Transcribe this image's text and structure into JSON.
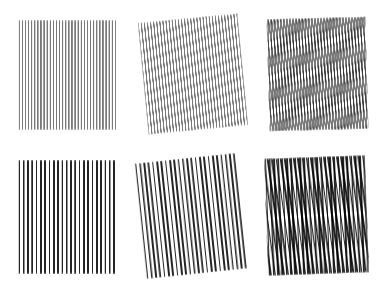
{
  "figure": {
    "background_color": "#ffffff",
    "width": 388,
    "height": 291,
    "rows": 2,
    "columns": 3
  },
  "colors": {
    "background": "#ffffff",
    "line_stroke": "#6e6e6e",
    "dot_fill": "#191919"
  },
  "panels": [
    {
      "id": "panel-1",
      "name": "line-grating-base",
      "row": 1,
      "column": 1,
      "pattern": "vertical-line-grating",
      "x": 18,
      "y": 20,
      "width": 99,
      "height": 110,
      "layers": [
        {
          "type": "lines",
          "orientation": "vertical",
          "period_px": 3.1,
          "rotation_deg": 0,
          "stroke": "#6e6e6e"
        }
      ],
      "rotation_deg": 0,
      "caption": ""
    },
    {
      "id": "panel-2",
      "name": "line-grating-rotated",
      "row": 1,
      "column": 2,
      "pattern": "vertical-line-grating-rotated",
      "x": 143,
      "y": 18,
      "width": 100,
      "height": 112,
      "layers": [
        {
          "type": "lines",
          "orientation": "vertical",
          "period_px": 3.1,
          "rotation_deg": 0,
          "stroke": "#6e6e6e"
        }
      ],
      "rotation_deg": -5.5,
      "caption": ""
    },
    {
      "id": "panel-3",
      "name": "line-grating-moire-superposition",
      "row": 1,
      "column": 3,
      "pattern": "line-grating-moire",
      "x": 268,
      "y": 18,
      "width": 99,
      "height": 112,
      "layers": [
        {
          "type": "lines",
          "orientation": "vertical",
          "period_px": 3.1,
          "rotation_deg": 0,
          "stroke": "#6e6e6e"
        },
        {
          "type": "lines",
          "orientation": "vertical",
          "period_px": 3.1,
          "rotation_deg": -5.5,
          "stroke": "#6e6e6e"
        }
      ],
      "rotation_deg": -1.5,
      "moire_effect": "horizontal beat bands",
      "moire_band_period_px": 11.5,
      "moire_band_count": 10,
      "caption": ""
    },
    {
      "id": "panel-4",
      "name": "dot-grid-base",
      "row": 2,
      "column": 1,
      "pattern": "square-dot-grid",
      "x": 17,
      "y": 160,
      "width": 100,
      "height": 114,
      "layers": [
        {
          "type": "dots",
          "pitch_px": 4.3,
          "dot_size_px": 1.6,
          "rotation_deg": 0,
          "fill": "#191919"
        }
      ],
      "rotation_deg": 0,
      "caption": ""
    },
    {
      "id": "panel-5",
      "name": "dot-grid-rotated",
      "row": 2,
      "column": 2,
      "pattern": "square-dot-grid-rotated",
      "x": 140,
      "y": 158,
      "width": 102,
      "height": 116,
      "layers": [
        {
          "type": "dots",
          "pitch_px": 4.3,
          "dot_size_px": 1.6,
          "rotation_deg": 0,
          "fill": "#191919"
        }
      ],
      "rotation_deg": -6,
      "caption": ""
    },
    {
      "id": "panel-6",
      "name": "dot-grid-moire-superposition",
      "row": 2,
      "column": 3,
      "pattern": "dot-grid-moire",
      "x": 266,
      "y": 157,
      "width": 101,
      "height": 117,
      "layers": [
        {
          "type": "dots",
          "pitch_px": 4.3,
          "dot_size_px": 1.6,
          "rotation_deg": 0,
          "fill": "#191919"
        },
        {
          "type": "dots",
          "pitch_px": 4.3,
          "dot_size_px": 1.6,
          "rotation_deg": -6,
          "fill": "#191919"
        }
      ],
      "rotation_deg": -2,
      "moire_effect": "two-dimensional square lattice",
      "moire_cell_size_px": 22,
      "moire_cell_columns": 5,
      "moire_cell_rows": 5,
      "caption": ""
    }
  ],
  "chart_data": {
    "type": "table",
    "xlabel": "",
    "ylabel": "",
    "columns": [
      "panel",
      "pattern",
      "layers",
      "layer rotations (deg)",
      "moire effect"
    ],
    "rows": [
      [
        "1",
        "vertical line grating",
        "1",
        "0",
        "none"
      ],
      [
        "2",
        "vertical line grating",
        "1",
        "-5.5",
        "none"
      ],
      [
        "3",
        "superimposed line gratings",
        "2",
        "0, -5.5",
        "horizontal beat bands, period 11.5 px"
      ],
      [
        "4",
        "square dot grid",
        "1",
        "0",
        "none"
      ],
      [
        "5",
        "square dot grid",
        "1",
        "-6",
        "none"
      ],
      [
        "6",
        "superimposed dot grids",
        "2",
        "0, -6",
        "2D lattice, cell 22 px, 5x5 cells"
      ]
    ]
  }
}
